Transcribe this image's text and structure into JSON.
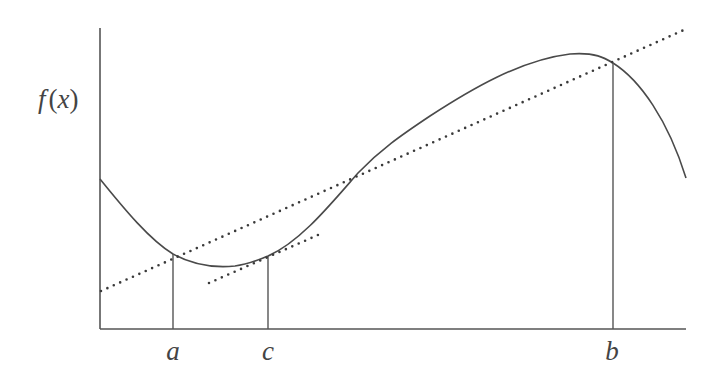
{
  "diagram": {
    "title": "",
    "y_axis_label": {
      "func": "f",
      "open": "(",
      "var": "x",
      "close": ")"
    },
    "x_labels": {
      "a": "a",
      "c": "c",
      "b": "b"
    },
    "colors": {
      "axis": "#555555",
      "curve": "#4a4a4a",
      "dotted": "#3a3a3a",
      "text": "#444444",
      "background": "#ffffff"
    },
    "elements": {
      "curve": "smooth curve f(x)",
      "secant_line": "dotted secant through (a,f(a)) and (b,f(b))",
      "tangent_line": "dotted tangent at c, parallel to secant",
      "vertical_lines": [
        "x = a",
        "x = c",
        "x = b"
      ]
    }
  }
}
